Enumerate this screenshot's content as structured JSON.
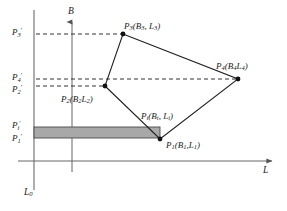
{
  "figure": {
    "type": "line-diagram"
  },
  "axes": {
    "vertical_axis_label": "B",
    "horizontal_axis_label": "L",
    "boundary_line_label": "L",
    "boundary_line_sub": "0"
  },
  "ticks": [
    {
      "name": "P3-prime",
      "base": "P",
      "sub": "3",
      "prime": "′"
    },
    {
      "name": "P4-prime",
      "base": "P",
      "sub": "4",
      "prime": "′"
    },
    {
      "name": "P2-prime",
      "base": "P",
      "sub": "2",
      "prime": "′"
    },
    {
      "name": "Pi-prime",
      "base": "P",
      "sub": "i",
      "prime": "′"
    },
    {
      "name": "P1-prime",
      "base": "P",
      "sub": "1",
      "prime": "′"
    }
  ],
  "points": [
    {
      "name": "P1",
      "label": "P",
      "sub": "1",
      "args": "(B",
      "argsub": "1",
      "args2": ",L",
      "argsub2": "1",
      "close": ")"
    },
    {
      "name": "P2",
      "label": "P",
      "sub": "2",
      "args": "(B",
      "argsub": "2",
      "args2": "L",
      "argsub2": "2",
      "close": ")"
    },
    {
      "name": "P3",
      "label": "P",
      "sub": "3",
      "args": "(B",
      "argsub": "3",
      "args2": ", L",
      "argsub2": "3",
      "close": ")"
    },
    {
      "name": "P4",
      "label": "P",
      "sub": "4",
      "args": "(B",
      "argsub": "4",
      "args2": "L",
      "argsub2": "4",
      "close": ")"
    },
    {
      "name": "Pi",
      "label": "P",
      "sub": "i",
      "args": "(B",
      "argsub": "i",
      "args2": ", L",
      "argsub2": "i",
      "close": ")"
    }
  ],
  "labels": {
    "p3_full": "P₃(B₃, L₃)",
    "p4_full": "P₄(B₄L₄)",
    "p2_full": "P₂(B₂L₂)",
    "p1_full": "P₁(B₁L₁)",
    "pi_full": "Pᵢ(Bᵢ, Lᵢ)"
  },
  "colors": {
    "stroke": "#222222",
    "axis": "#555555",
    "dashed": "#333333",
    "band_fill": "#a8a8a8",
    "band_stroke": "#4a4a4a",
    "background": "#ffffff"
  },
  "geometry": {
    "boundary_line_x": 34,
    "b_axis_x": 72,
    "l_axis_y": 161,
    "vertices": [
      {
        "id": "P3",
        "x": 123,
        "y": 34
      },
      {
        "id": "P4",
        "x": 238,
        "y": 79
      },
      {
        "id": "P1",
        "x": 160,
        "y": 139
      },
      {
        "id": "P2",
        "x": 105,
        "y": 86
      }
    ],
    "band": {
      "x": 34,
      "y": 127,
      "width": 126,
      "height": 11
    }
  }
}
